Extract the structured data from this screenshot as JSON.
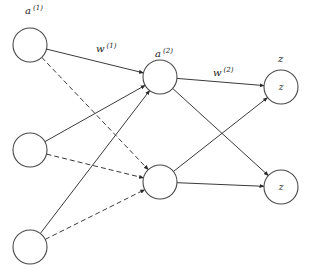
{
  "diagram": {
    "type": "neural-network",
    "colors": {
      "stroke": "#3a3a3a",
      "node_fill": "#ffffff",
      "text": "#222222"
    },
    "layers": [
      {
        "name": "input",
        "label": "a",
        "superscript": "(1)",
        "nodes": [
          {
            "id": "i1",
            "cx": 30,
            "cy": 45,
            "r": 17,
            "text": ""
          },
          {
            "id": "i2",
            "cx": 30,
            "cy": 150,
            "r": 17,
            "text": ""
          },
          {
            "id": "i3",
            "cx": 30,
            "cy": 247,
            "r": 17,
            "text": ""
          }
        ]
      },
      {
        "name": "hidden",
        "label": "a",
        "superscript": "(2)",
        "nodes": [
          {
            "id": "h1",
            "cx": 160,
            "cy": 77,
            "r": 17,
            "text": ""
          },
          {
            "id": "h2",
            "cx": 160,
            "cy": 182,
            "r": 17,
            "text": ""
          }
        ]
      },
      {
        "name": "output",
        "label": "z",
        "superscript": "",
        "nodes": [
          {
            "id": "o1",
            "cx": 281,
            "cy": 87,
            "r": 17,
            "text": "z"
          },
          {
            "id": "o2",
            "cx": 281,
            "cy": 187,
            "r": 17,
            "text": "z"
          }
        ]
      }
    ],
    "weights": [
      {
        "label": "w",
        "superscript": "(1)"
      },
      {
        "label": "w",
        "superscript": "(2)"
      }
    ],
    "edges": [
      {
        "from": "i1",
        "to": "h1",
        "style": "solid"
      },
      {
        "from": "i1",
        "to": "h2",
        "style": "dashed"
      },
      {
        "from": "i2",
        "to": "h1",
        "style": "solid"
      },
      {
        "from": "i2",
        "to": "h2",
        "style": "dashed"
      },
      {
        "from": "i3",
        "to": "h1",
        "style": "solid"
      },
      {
        "from": "i3",
        "to": "h2",
        "style": "dashed"
      },
      {
        "from": "h1",
        "to": "o1",
        "style": "solid"
      },
      {
        "from": "h1",
        "to": "o2",
        "style": "solid"
      },
      {
        "from": "h2",
        "to": "o1",
        "style": "solid"
      },
      {
        "from": "h2",
        "to": "o2",
        "style": "solid"
      }
    ]
  },
  "labels": {
    "input_layer": {
      "base": "a",
      "sup": "(1)"
    },
    "weights_1": {
      "base": "w",
      "sup": "(1)"
    },
    "hidden_layer": {
      "base": "a",
      "sup": "(2)"
    },
    "weights_2": {
      "base": "w",
      "sup": "(2)"
    },
    "output_layer": {
      "base": "z"
    },
    "output_node_1": "z",
    "output_node_2": "z"
  }
}
